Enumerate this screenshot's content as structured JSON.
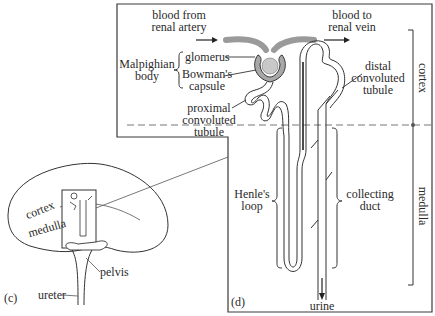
{
  "figure": {
    "panel_c_label": "(c)",
    "panel_d_label": "(d)"
  },
  "kidney": {
    "cortex": "cortex",
    "medulla": "medulla",
    "pelvis": "pelvis",
    "ureter": "ureter"
  },
  "nephron": {
    "blood_in": "blood from\nrenal artery",
    "blood_out": "blood to\nrenal vein",
    "malpighian": "Malpighian\nbody",
    "glomerus": "glomerus",
    "bowmans": "Bowman's\ncapsule",
    "proximal": "proximal\nconvoluted\ntubule",
    "distal": "distal\nconvoluted\ntubule",
    "henle": "Henle's\nloop",
    "collecting": "collecting\nduct",
    "urine": "urine"
  },
  "zones": {
    "cortex": "cortex",
    "medulla": "medulla"
  },
  "colors": {
    "line": "#2a2a2a",
    "vessel": "#9a9a9a",
    "dashed": "#777777"
  }
}
